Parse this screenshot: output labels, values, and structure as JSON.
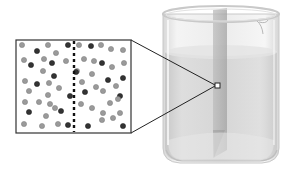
{
  "figure": {
    "colors": {
      "background": "#ffffff",
      "inset_border": "#333333",
      "boundary_dash": "#111111",
      "particle_light": "#9a9a9a",
      "particle_light_stroke": "#7a7a7a",
      "particle_dark": "#333333",
      "particle_dark_stroke": "#1a1a1a",
      "beaker_glass": "#e6e6e6",
      "beaker_rim": "#d4d4d4",
      "liquid": "#cfcfcf",
      "divider_shade": "#a9a9a9",
      "connector_line": "#222222"
    },
    "inset": {
      "x": 16,
      "y": 40,
      "width": 115,
      "height": 93,
      "boundary_x": 74,
      "particles": [
        {
          "x": 22,
          "y": 45,
          "t": "l"
        },
        {
          "x": 37,
          "y": 51,
          "t": "d"
        },
        {
          "x": 48,
          "y": 45,
          "t": "l"
        },
        {
          "x": 68,
          "y": 45,
          "t": "d"
        },
        {
          "x": 56,
          "y": 53,
          "t": "l"
        },
        {
          "x": 24,
          "y": 60,
          "t": "l"
        },
        {
          "x": 31,
          "y": 65,
          "t": "d"
        },
        {
          "x": 44,
          "y": 59,
          "t": "l"
        },
        {
          "x": 52,
          "y": 63,
          "t": "d"
        },
        {
          "x": 66,
          "y": 61,
          "t": "l"
        },
        {
          "x": 43,
          "y": 71,
          "t": "l"
        },
        {
          "x": 54,
          "y": 76,
          "t": "d"
        },
        {
          "x": 25,
          "y": 81,
          "t": "l"
        },
        {
          "x": 37,
          "y": 84,
          "t": "d"
        },
        {
          "x": 49,
          "y": 83,
          "t": "l"
        },
        {
          "x": 59,
          "y": 88,
          "t": "l"
        },
        {
          "x": 29,
          "y": 91,
          "t": "l"
        },
        {
          "x": 48,
          "y": 95,
          "t": "l"
        },
        {
          "x": 70,
          "y": 96,
          "t": "d"
        },
        {
          "x": 25,
          "y": 102,
          "t": "l"
        },
        {
          "x": 39,
          "y": 102,
          "t": "l"
        },
        {
          "x": 50,
          "y": 104,
          "t": "l"
        },
        {
          "x": 55,
          "y": 108,
          "t": "l"
        },
        {
          "x": 61,
          "y": 111,
          "t": "d"
        },
        {
          "x": 29,
          "y": 112,
          "t": "d"
        },
        {
          "x": 46,
          "y": 116,
          "t": "l"
        },
        {
          "x": 24,
          "y": 124,
          "t": "l"
        },
        {
          "x": 42,
          "y": 126,
          "t": "l"
        },
        {
          "x": 58,
          "y": 124,
          "t": "l"
        },
        {
          "x": 68,
          "y": 125,
          "t": "d"
        },
        {
          "x": 79,
          "y": 45,
          "t": "l"
        },
        {
          "x": 91,
          "y": 46,
          "t": "d"
        },
        {
          "x": 101,
          "y": 45,
          "t": "l"
        },
        {
          "x": 111,
          "y": 49,
          "t": "l"
        },
        {
          "x": 123,
          "y": 50,
          "t": "l"
        },
        {
          "x": 84,
          "y": 59,
          "t": "l"
        },
        {
          "x": 94,
          "y": 61,
          "t": "l"
        },
        {
          "x": 102,
          "y": 63,
          "t": "d"
        },
        {
          "x": 124,
          "y": 63,
          "t": "l"
        },
        {
          "x": 77,
          "y": 71,
          "t": "l"
        },
        {
          "x": 76,
          "y": 72,
          "t": "d"
        },
        {
          "x": 92,
          "y": 74,
          "t": "l"
        },
        {
          "x": 112,
          "y": 67,
          "t": "l"
        },
        {
          "x": 108,
          "y": 80,
          "t": "d"
        },
        {
          "x": 123,
          "y": 78,
          "t": "d"
        },
        {
          "x": 82,
          "y": 82,
          "t": "l"
        },
        {
          "x": 96,
          "y": 87,
          "t": "l"
        },
        {
          "x": 116,
          "y": 86,
          "t": "l"
        },
        {
          "x": 85,
          "y": 92,
          "t": "d"
        },
        {
          "x": 103,
          "y": 91,
          "t": "l"
        },
        {
          "x": 120,
          "y": 96,
          "t": "d"
        },
        {
          "x": 81,
          "y": 104,
          "t": "l"
        },
        {
          "x": 92,
          "y": 108,
          "t": "l"
        },
        {
          "x": 110,
          "y": 103,
          "t": "l"
        },
        {
          "x": 118,
          "y": 99,
          "t": "l"
        },
        {
          "x": 103,
          "y": 113,
          "t": "l"
        },
        {
          "x": 120,
          "y": 113,
          "t": "l"
        },
        {
          "x": 88,
          "y": 126,
          "t": "d"
        },
        {
          "x": 102,
          "y": 120,
          "t": "l"
        },
        {
          "x": 113,
          "y": 118,
          "t": "l"
        },
        {
          "x": 123,
          "y": 126,
          "t": "d"
        }
      ]
    },
    "magnify_marker": {
      "x": 215,
      "y": 83,
      "size": 5
    },
    "connectors": [
      {
        "x1": 131,
        "y1": 40,
        "x2": 215,
        "y2": 85
      },
      {
        "x1": 131,
        "y1": 133,
        "x2": 215,
        "y2": 86
      }
    ]
  }
}
